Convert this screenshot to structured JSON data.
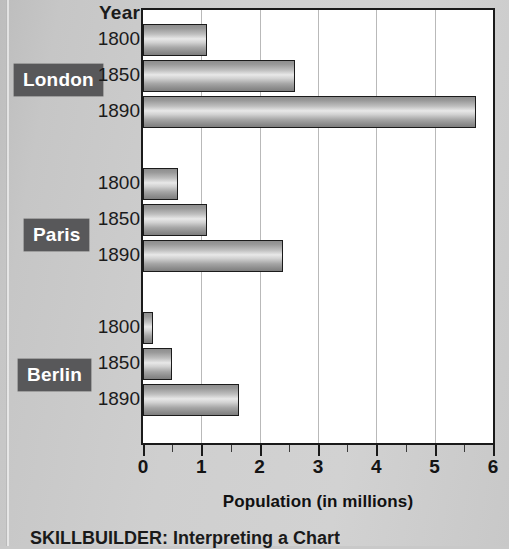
{
  "chart_data": {
    "type": "bar",
    "orientation": "horizontal",
    "title": "",
    "xlabel": "Population (in millions)",
    "ylabel": "Year",
    "xlim": [
      0,
      6
    ],
    "xticks": [
      0,
      1,
      2,
      3,
      4,
      5,
      6
    ],
    "xtick_labels": [
      "0",
      "1",
      "2",
      "3",
      "4",
      "5",
      "6"
    ],
    "minor_tick_step": 0.5,
    "grid": "vertical gridlines at each integer",
    "legend": "none",
    "group_label_header": "Year",
    "groups": [
      {
        "name": "London",
        "categories": [
          "1800",
          "1850",
          "1890"
        ],
        "values": [
          1.1,
          2.6,
          5.7
        ]
      },
      {
        "name": "Paris",
        "categories": [
          "1800",
          "1850",
          "1890"
        ],
        "values": [
          0.6,
          1.1,
          2.4
        ]
      },
      {
        "name": "Berlin",
        "categories": [
          "1800",
          "1850",
          "1890"
        ],
        "values": [
          0.17,
          0.5,
          1.65
        ]
      }
    ]
  },
  "axis": {
    "x_title": "Population (in millions)",
    "year_header": "Year"
  },
  "caption": {
    "text": "SKILLBUILDER: Interpreting a Chart"
  },
  "colors": {
    "page_background": "#cfcfcf",
    "plot_background": "#ffffff",
    "axis_line": "#1a1a1a",
    "gridline": "#b9b9b9",
    "bar_outline": "#1b1b1b",
    "bar_fill_light": "#e8e8e8",
    "bar_fill_dark": "#7e7e7e",
    "city_tag_background": "#58585a",
    "city_tag_text": "#ffffff",
    "text": "#1b1b1b"
  }
}
